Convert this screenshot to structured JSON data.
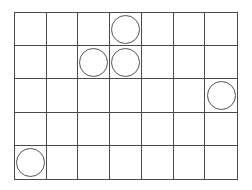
{
  "board": {
    "rows": 5,
    "cols": 7,
    "line_color": "#4a4a4a",
    "piece_color": "#555555",
    "pieces": [
      {
        "row": 0,
        "col": 3
      },
      {
        "row": 1,
        "col": 2
      },
      {
        "row": 1,
        "col": 3
      },
      {
        "row": 2,
        "col": 6
      },
      {
        "row": 4,
        "col": 0
      }
    ]
  }
}
